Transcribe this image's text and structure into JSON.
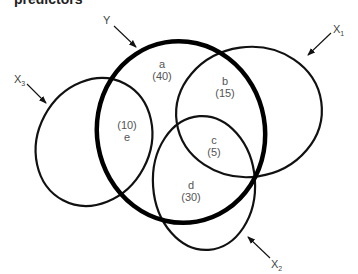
{
  "title_fragment": "predictors",
  "diagram": {
    "type": "venn",
    "sets": [
      {
        "id": "Y",
        "label": "Y",
        "emphasis": "bold"
      },
      {
        "id": "X1",
        "label": "X",
        "subscript": "1"
      },
      {
        "id": "X2",
        "label": "X",
        "subscript": "2"
      },
      {
        "id": "X3",
        "label": "X",
        "subscript": "3"
      }
    ],
    "regions": [
      {
        "id": "a",
        "letter": "a",
        "value": "(40)"
      },
      {
        "id": "b",
        "letter": "b",
        "value": "(15)"
      },
      {
        "id": "c",
        "letter": "c",
        "value": "(5)"
      },
      {
        "id": "d",
        "letter": "d",
        "value": "(30)"
      },
      {
        "id": "e",
        "letter": "e",
        "value": "(10)"
      }
    ]
  }
}
